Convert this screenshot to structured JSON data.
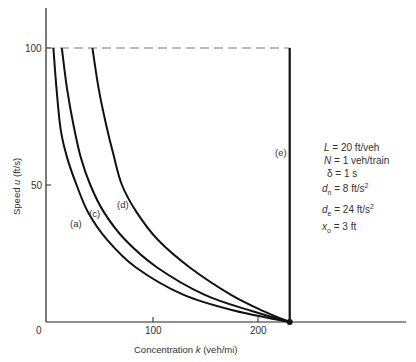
{
  "chart_data": {
    "type": "line",
    "title": "",
    "xlabel": "Concentration k (veh/mi)",
    "ylabel": "Speed u (ft/s)",
    "xlim": [
      0,
      260
    ],
    "ylim": [
      0,
      115
    ],
    "x_ticks": [
      0,
      100,
      200
    ],
    "y_ticks": [
      0,
      50,
      100
    ],
    "grid": false,
    "reference_lines": [
      {
        "type": "horizontal-dashed",
        "y": 100,
        "x_range": [
          0,
          231
        ]
      }
    ],
    "series": [
      {
        "name": "(a)",
        "points": [
          [
            7,
            100
          ],
          [
            10,
            85
          ],
          [
            14,
            70
          ],
          [
            20,
            60
          ],
          [
            29,
            50
          ],
          [
            40,
            40
          ],
          [
            58,
            30
          ],
          [
            85,
            20
          ],
          [
            130,
            10
          ],
          [
            180,
            4
          ],
          [
            231,
            0
          ]
        ]
      },
      {
        "name": "(c)",
        "points": [
          [
            15,
            100
          ],
          [
            20,
            85
          ],
          [
            26,
            72
          ],
          [
            33,
            60
          ],
          [
            42,
            50
          ],
          [
            55,
            40
          ],
          [
            75,
            30
          ],
          [
            105,
            20
          ],
          [
            150,
            10
          ],
          [
            195,
            4
          ],
          [
            231,
            0
          ]
        ]
      },
      {
        "name": "(d)",
        "points": [
          [
            44,
            100
          ],
          [
            50,
            85
          ],
          [
            57,
            72
          ],
          [
            64,
            61
          ],
          [
            72,
            50
          ],
          [
            86,
            40
          ],
          [
            106,
            30
          ],
          [
            136,
            20
          ],
          [
            175,
            10
          ],
          [
            206,
            4
          ],
          [
            231,
            0
          ]
        ]
      },
      {
        "name": "(e)",
        "points": [
          [
            231,
            0
          ],
          [
            231,
            100
          ]
        ]
      }
    ],
    "annotations": {
      "jam_point": [
        231,
        0
      ],
      "parameters": [
        "L = 20 ft/veh",
        "N = 1 veh/train",
        "δ = 1 s",
        "dn = 8 ft/s²",
        "de = 24 ft/s²",
        "xo = 3 ft"
      ]
    }
  },
  "labels": {
    "x_title_prefix": "Concentration ",
    "x_title_var": "k",
    "x_title_unit": " (veh/mi)",
    "y_title_prefix": "Speed ",
    "y_title_var": "u",
    "y_title_unit": " (ft/s)",
    "tick_x0": "0",
    "tick_x100": "100",
    "tick_x200": "200",
    "tick_y50": "50",
    "tick_y100": "100",
    "curve_a": "(a)",
    "curve_c": "(c)",
    "curve_d": "(d)",
    "curve_e": "(e)"
  },
  "params": {
    "L_var": "L",
    "L_val": " = 20 ft/veh",
    "N_var": "N",
    "N_val": " = 1 veh/train",
    "delta_var": "δ",
    "delta_val": " = 1 s",
    "dn_var": "d",
    "dn_sub": "n",
    "dn_val": " = 8 ft/s",
    "dn_sup": "2",
    "de_var": "d",
    "de_sub": "e",
    "de_val": " = 24 ft/s",
    "de_sup": "2",
    "xo_var": "x",
    "xo_sub": "o",
    "xo_val": " = 3 ft"
  }
}
